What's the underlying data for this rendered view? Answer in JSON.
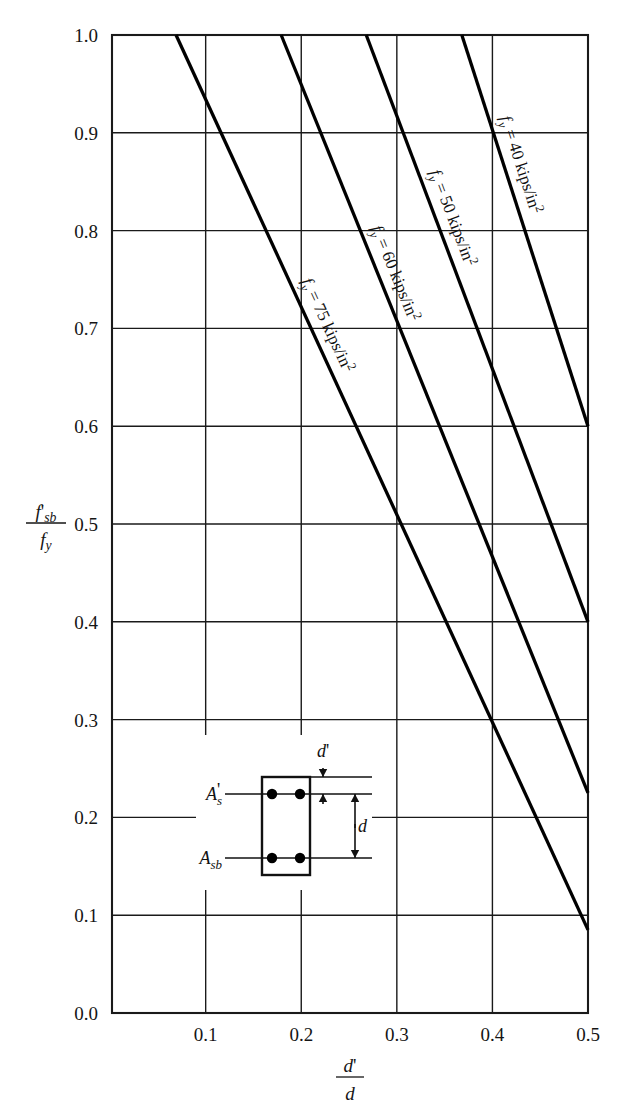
{
  "chart_data": {
    "type": "line",
    "title": "",
    "xlabel": "d'/d",
    "ylabel": "f'_sb / f_y",
    "xlim": [
      0.002,
      0.5
    ],
    "ylim": [
      0.0,
      1.0
    ],
    "grid": true,
    "legend_position": "inline-along-curves",
    "x_ticks": [
      "0.1",
      "0.2",
      "0.3",
      "0.4",
      "0.5"
    ],
    "x_tick_values": [
      0.1,
      0.2,
      0.3,
      0.4,
      0.5
    ],
    "y_ticks": [
      "0.0",
      "0.1",
      "0.2",
      "0.3",
      "0.4",
      "0.5",
      "0.6",
      "0.7",
      "0.8",
      "0.9",
      "1.0"
    ],
    "y_tick_values": [
      0.0,
      0.1,
      0.2,
      0.3,
      0.4,
      0.5,
      0.6,
      0.7,
      0.8,
      0.9,
      1.0
    ],
    "series": [
      {
        "name": "fy = 75 kips/in2",
        "fy": 75,
        "label_parts": {
          "symbol": "f",
          "symbol_sub": "y",
          "equals": "=",
          "value": "75",
          "units": "kips/in",
          "units_sup": "2"
        },
        "points": [
          [
            0.069,
            1.0
          ],
          [
            0.5,
            0.085
          ]
        ]
      },
      {
        "name": "fy = 60 kips/in2",
        "fy": 60,
        "label_parts": {
          "symbol": "f",
          "symbol_sub": "y",
          "equals": "=",
          "value": "60",
          "units": "kips/in",
          "units_sup": "2"
        },
        "points": [
          [
            0.179,
            1.0
          ],
          [
            0.5,
            0.225
          ]
        ]
      },
      {
        "name": "fy = 50 kips/in2",
        "fy": 50,
        "label_parts": {
          "symbol": "f",
          "symbol_sub": "y",
          "equals": "=",
          "value": "50",
          "units": "kips/in",
          "units_sup": "2"
        },
        "points": [
          [
            0.268,
            1.0
          ],
          [
            0.5,
            0.4
          ]
        ]
      },
      {
        "name": "fy = 40 kips/in2",
        "fy": 40,
        "label_parts": {
          "symbol": "f",
          "symbol_sub": "y",
          "equals": "=",
          "value": "40",
          "units": "kips/in",
          "units_sup": "2"
        },
        "points": [
          [
            0.368,
            1.0
          ],
          [
            0.5,
            0.6
          ]
        ]
      }
    ]
  },
  "axis": {
    "y_label_numerator": "f",
    "y_label_numerator_sub": "sb",
    "y_label_numerator_prime": "'",
    "y_label_denominator": "f",
    "y_label_denominator_sub": "y",
    "x_label_numerator": "d",
    "x_label_numerator_prime": "'",
    "x_label_denominator": "d"
  },
  "inset": {
    "name": "beam-cross-section",
    "top_steel_label": "A",
    "top_steel_sub": "s",
    "top_steel_prime": "'",
    "bottom_steel_label": "A",
    "bottom_steel_sub": "sb",
    "dim_top_label": "d",
    "dim_top_prime": "'",
    "dim_depth_label": "d",
    "bar_count_top": 2,
    "bar_count_bottom": 2
  },
  "colors": {
    "line": "#000000",
    "grid": "#1a1a1a",
    "background": "#ffffff",
    "text": "#151515"
  }
}
